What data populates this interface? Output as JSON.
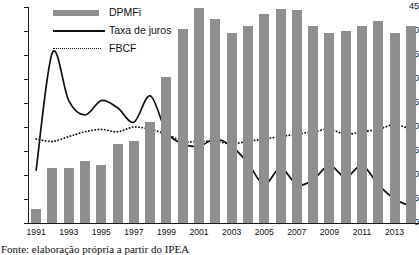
{
  "chart_data": {
    "type": "bar",
    "title": "",
    "xlabel": "",
    "ylabel": "",
    "ylim": [
      0,
      45
    ],
    "ytick_values": [
      0,
      5,
      10,
      15,
      20,
      25,
      30,
      35,
      40,
      45
    ],
    "grid": false,
    "legend_position": "top-left",
    "categories": [
      1991,
      1992,
      1993,
      1994,
      1995,
      1996,
      1997,
      1998,
      1999,
      2000,
      2001,
      2002,
      2003,
      2004,
      2005,
      2006,
      2007,
      2008,
      2009,
      2010,
      2011,
      2012,
      2013,
      2014
    ],
    "xtick_labels": [
      "1991",
      "1993",
      "1995",
      "1997",
      "1999",
      "2001",
      "2003",
      "2005",
      "2007",
      "2009",
      "2011",
      "2013"
    ],
    "series": [
      {
        "name": "DPMFi",
        "type": "bar",
        "color": "#8f8f8f",
        "values": [
          3.0,
          11.5,
          11.5,
          13.0,
          12.0,
          16.5,
          17.0,
          21.0,
          30.5,
          40.5,
          44.8,
          42.5,
          39.5,
          41.0,
          43.5,
          44.5,
          44.3,
          41.0,
          39.5,
          40.0,
          41.0,
          42.0,
          39.5,
          41.0
        ]
      },
      {
        "name": "Taxa de juros",
        "type": "line",
        "color": "#111111",
        "style": "solid",
        "values": [
          11.0,
          35.5,
          25.5,
          22.5,
          25.5,
          24.0,
          21.0,
          26.5,
          19.0,
          16.5,
          16.0,
          17.5,
          16.0,
          12.5,
          8.0,
          11.5,
          8.0,
          9.0,
          12.0,
          9.5,
          12.0,
          8.0,
          5.0,
          3.5
        ]
      },
      {
        "name": "FBCF",
        "type": "line",
        "color": "#111111",
        "style": "dotted",
        "values": [
          17.5,
          17.0,
          18.0,
          19.0,
          19.5,
          19.0,
          20.0,
          19.5,
          18.5,
          17.0,
          17.0,
          17.0,
          16.5,
          17.0,
          17.5,
          18.0,
          18.5,
          19.0,
          19.5,
          18.5,
          19.0,
          19.5,
          20.5,
          19.5
        ]
      }
    ]
  },
  "legend": {
    "items": [
      {
        "label": "DPMFi",
        "marker": "bar-swatch"
      },
      {
        "label": "Taxa de juros",
        "marker": "solid-line"
      },
      {
        "label": "FBCF",
        "marker": "dotted-line"
      }
    ]
  },
  "caption": {
    "text": "Fonte: elaboração própria a partir do IPEA"
  }
}
